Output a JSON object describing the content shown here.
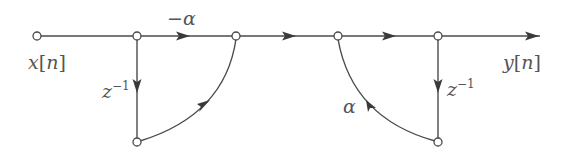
{
  "diagram": {
    "type": "signal-flow-graph",
    "input_label": {
      "var": "x",
      "open": "[",
      "idx": "n",
      "close": "]"
    },
    "output_label": {
      "var": "y",
      "open": "[",
      "idx": "n",
      "close": "]"
    },
    "gain_top": "−α",
    "gain_feedback": "α",
    "delay_left": {
      "base": "z",
      "exp": "−1"
    },
    "delay_right": {
      "base": "z",
      "exp": "−1"
    },
    "colors": {
      "line": "#4a4a4a",
      "text": "#555555",
      "background": "#ffffff"
    },
    "nodes": [
      {
        "id": "n0",
        "x": 37,
        "y": 36
      },
      {
        "id": "n1",
        "x": 137,
        "y": 36
      },
      {
        "id": "n2",
        "x": 236,
        "y": 36
      },
      {
        "id": "n3",
        "x": 338,
        "y": 36
      },
      {
        "id": "n4",
        "x": 438,
        "y": 36
      },
      {
        "id": "n5",
        "x": 137,
        "y": 142
      },
      {
        "id": "n6",
        "x": 438,
        "y": 142
      }
    ],
    "edges": [
      {
        "from": "n0",
        "to": "n1",
        "gain": ""
      },
      {
        "from": "n1",
        "to": "n2",
        "gain": "−α"
      },
      {
        "from": "n2",
        "to": "n3",
        "gain": ""
      },
      {
        "from": "n3",
        "to": "n4",
        "gain": ""
      },
      {
        "from": "n4",
        "to": "out",
        "gain": ""
      },
      {
        "from": "n1",
        "to": "n5",
        "gain": "z^-1"
      },
      {
        "from": "n5",
        "to": "n2",
        "gain": ""
      },
      {
        "from": "n4",
        "to": "n6",
        "gain": "z^-1"
      },
      {
        "from": "n6",
        "to": "n3",
        "gain": "α"
      }
    ]
  }
}
